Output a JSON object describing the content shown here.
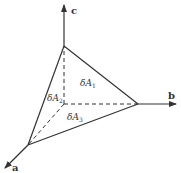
{
  "diagram": {
    "type": "tetrahedron-stress-element",
    "colors": {
      "line": "#333333",
      "background": "#ffffff"
    },
    "axes": [
      {
        "id": "a",
        "label": "a"
      },
      {
        "id": "b",
        "label": "b"
      },
      {
        "id": "c",
        "label": "c"
      }
    ],
    "faces": [
      {
        "id": "A1",
        "prefix": "δA",
        "subscript": "1"
      },
      {
        "id": "A2",
        "prefix": "δA",
        "subscript": "2"
      },
      {
        "id": "A3",
        "prefix": "δA",
        "subscript": "3"
      }
    ]
  }
}
